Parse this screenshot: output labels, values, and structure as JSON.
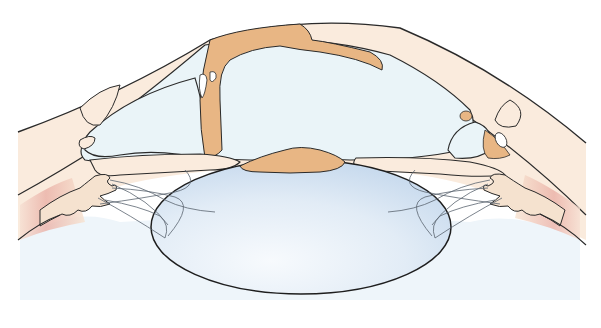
{
  "figure": {
    "labels": [],
    "colors": {
      "background": "#ffffff",
      "outline": "#2a2a2a",
      "cornea_fill": "#faebdd",
      "tissue_fill": "#f7e3d0",
      "deposit_fill": "#e8b684",
      "chamber_fill": "#eaf4f8",
      "lens_fill": "#d5e3f1",
      "lens_highlight": "#f4f8fc",
      "vitreous_fill": "#eef5fa",
      "ciliary_muscle": "#e8a9a0",
      "zonule_stroke": "#5a6470"
    },
    "structures": [
      {
        "name": "cornea"
      },
      {
        "name": "anterior-chamber"
      },
      {
        "name": "central-deposit-upper"
      },
      {
        "name": "central-deposit-on-lens"
      },
      {
        "name": "lens"
      },
      {
        "name": "iris-left"
      },
      {
        "name": "iris-right"
      },
      {
        "name": "ciliary-body-left"
      },
      {
        "name": "ciliary-body-right"
      },
      {
        "name": "zonules-left"
      },
      {
        "name": "zonules-right"
      },
      {
        "name": "vitreous"
      }
    ]
  }
}
